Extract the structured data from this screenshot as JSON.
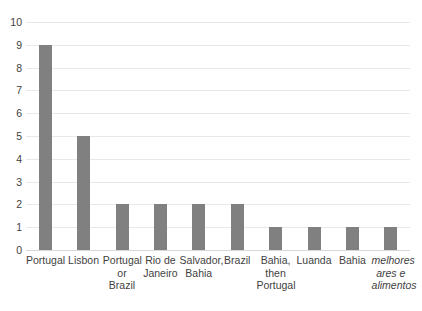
{
  "chart_data": {
    "type": "bar",
    "title": "",
    "subtitle": "",
    "xlabel": "",
    "ylabel": "",
    "categories": [
      "Portugal",
      "Lisbon",
      "Portugal or Brazil",
      "Rio de Janeiro",
      "Salvador, Bahia",
      "Brazil",
      "Bahia, then Portugal",
      "Luanda",
      "Bahia",
      "melhores ares e alimentos"
    ],
    "values": [
      9,
      5,
      2,
      2,
      2,
      2,
      1,
      1,
      1,
      1
    ],
    "ylim": [
      0,
      10
    ],
    "ytick_labels": [
      "0",
      "1",
      "2",
      "3",
      "4",
      "5",
      "6",
      "7",
      "8",
      "9",
      "10"
    ],
    "ytick_values": [
      0,
      1,
      2,
      3,
      4,
      5,
      6,
      7,
      8,
      9,
      10
    ],
    "grid": true,
    "grid_axis": "y",
    "legend": false,
    "legend_position": "none",
    "bar_color": "#808080",
    "gridline_color": "#e8e8e8",
    "axis_text_color": "#3f3f3f",
    "background_color": "#ffffff",
    "italic_categories": [
      "melhores ares e alimentos"
    ]
  }
}
